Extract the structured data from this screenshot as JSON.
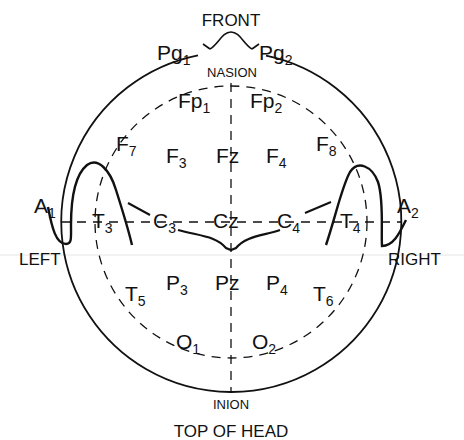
{
  "title": "FRONT",
  "footer": "TOP OF HEAD",
  "landmarks": {
    "nasion": "NASION",
    "inion": "INION",
    "left": "LEFT",
    "right": "RIGHT"
  },
  "colors": {
    "ink": "#111111",
    "background": "#ffffff",
    "faint_line": "#e6e6e6"
  },
  "electrodes": [
    {
      "id": "Pg1",
      "base": "Pg",
      "sub": "1"
    },
    {
      "id": "Pg2",
      "base": "Pg",
      "sub": "2"
    },
    {
      "id": "Fp1",
      "base": "Fp",
      "sub": "1"
    },
    {
      "id": "Fp2",
      "base": "Fp",
      "sub": "2"
    },
    {
      "id": "F7",
      "base": "F",
      "sub": "7"
    },
    {
      "id": "F3",
      "base": "F",
      "sub": "3"
    },
    {
      "id": "Fz",
      "base": "Fz",
      "sub": ""
    },
    {
      "id": "F4",
      "base": "F",
      "sub": "4"
    },
    {
      "id": "F8",
      "base": "F",
      "sub": "8"
    },
    {
      "id": "A1",
      "base": "A",
      "sub": "1"
    },
    {
      "id": "T3",
      "base": "T",
      "sub": "3"
    },
    {
      "id": "C3",
      "base": "C",
      "sub": "3"
    },
    {
      "id": "Cz",
      "base": "Cz",
      "sub": ""
    },
    {
      "id": "C4",
      "base": "C",
      "sub": "4"
    },
    {
      "id": "T4",
      "base": "T",
      "sub": "4"
    },
    {
      "id": "A2",
      "base": "A",
      "sub": "2"
    },
    {
      "id": "T5",
      "base": "T",
      "sub": "5"
    },
    {
      "id": "P3",
      "base": "P",
      "sub": "3"
    },
    {
      "id": "Pz",
      "base": "Pz",
      "sub": ""
    },
    {
      "id": "P4",
      "base": "P",
      "sub": "4"
    },
    {
      "id": "T6",
      "base": "T",
      "sub": "6"
    },
    {
      "id": "O1",
      "base": "O",
      "sub": "1"
    },
    {
      "id": "O2",
      "base": "O",
      "sub": "2"
    }
  ]
}
